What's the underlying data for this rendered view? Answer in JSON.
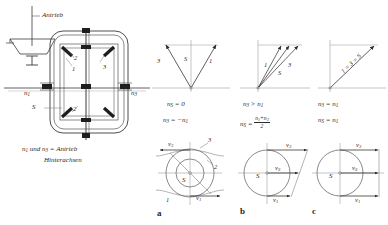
{
  "figure": {
    "type": "technical-diagram",
    "language": "de"
  },
  "mechanism": {
    "drive_label": "Antrieb",
    "left_shaft_label": "n",
    "left_shaft_sub": "1",
    "right_shaft_label": "n",
    "right_shaft_sub": "3",
    "cage_label": "S",
    "part_labels": [
      "1",
      "2",
      "3",
      "2"
    ],
    "caption_line1_a": "n",
    "caption_line1_a_sub": "1",
    "caption_line1_b": "und",
    "caption_line1_c": "n",
    "caption_line1_c_sub": "3",
    "caption_line1_d": "= Antrieb",
    "caption_line2": "Hinterachsen"
  },
  "vector_diagrams": [
    {
      "id": "v1",
      "arrow_labels": [
        "3",
        "S",
        "1"
      ],
      "condition": "n_S = 0",
      "condition_parts": {
        "lhs": "n",
        "lhs_sub": "S",
        "rel": "=",
        "rhs": "0"
      },
      "relation": "n_3 = -n_1",
      "relation_parts": {
        "lhs": "n",
        "lhs_sub": "3",
        "rel": "=",
        "rhs": "−n",
        "rhs_sub": "1"
      }
    },
    {
      "id": "v2",
      "arrow_labels": [
        "1",
        "S",
        "3"
      ],
      "condition": "n_3 > n_1",
      "condition_parts": {
        "lhs": "n",
        "lhs_sub": "3",
        "rel": ">",
        "rhs": "n",
        "rhs_sub": "1"
      },
      "relation": "n_S = (n_1 + n_3)/2",
      "relation_parts": {
        "lhs": "n",
        "lhs_sub": "S",
        "rel": "=",
        "num_a": "n",
        "num_a_sub": "1",
        "num_plus": "+",
        "num_b": "n",
        "num_b_sub": "3",
        "den": "2"
      }
    },
    {
      "id": "v3",
      "arrow_labels": [
        "1 = 3 = S"
      ],
      "condition": "n_3 = n_1",
      "condition_parts": {
        "lhs": "n",
        "lhs_sub": "3",
        "rel": "=",
        "rhs": "n",
        "rhs_sub": "1"
      },
      "relation": "n_S = n_1",
      "relation_parts": {
        "lhs": "n",
        "lhs_sub": "S",
        "rel": "=",
        "rhs": "n",
        "rhs_sub": "1"
      }
    }
  ],
  "circle_diagrams": [
    {
      "id": "a",
      "caption": "a",
      "center_label": "S",
      "velocity_top": "v",
      "velocity_top_sub": "3",
      "velocity_bottom": "v",
      "velocity_bottom_sub": "1",
      "ring_labels": [
        "3",
        "2",
        "1"
      ],
      "description": "v3 points left, v1 points right, equal magnitude, counter-rotating"
    },
    {
      "id": "b",
      "caption": "b",
      "center_label": "S",
      "velocity_top": "v",
      "velocity_top_sub": "3",
      "velocity_mid": "v",
      "velocity_mid_sub": "S",
      "velocity_bottom": "v",
      "velocity_bottom_sub": "1",
      "description": "v3 longest, vS mean, v1 shortest; tips joined by slanted line"
    },
    {
      "id": "c",
      "caption": "c",
      "center_label": "S",
      "velocity_top": "v",
      "velocity_top_sub": "3",
      "velocity_mid": "v",
      "velocity_mid_sub": "S",
      "velocity_bottom": "v",
      "velocity_bottom_sub": "1",
      "description": "all three velocities equal; tips joined by vertical line"
    }
  ],
  "colors": {
    "ink": "#2b2b2b",
    "line": "#3a3a3a",
    "gear_fill": "#1e1e1e",
    "paper": "#ffffff",
    "faint": "#9a9a9a"
  }
}
